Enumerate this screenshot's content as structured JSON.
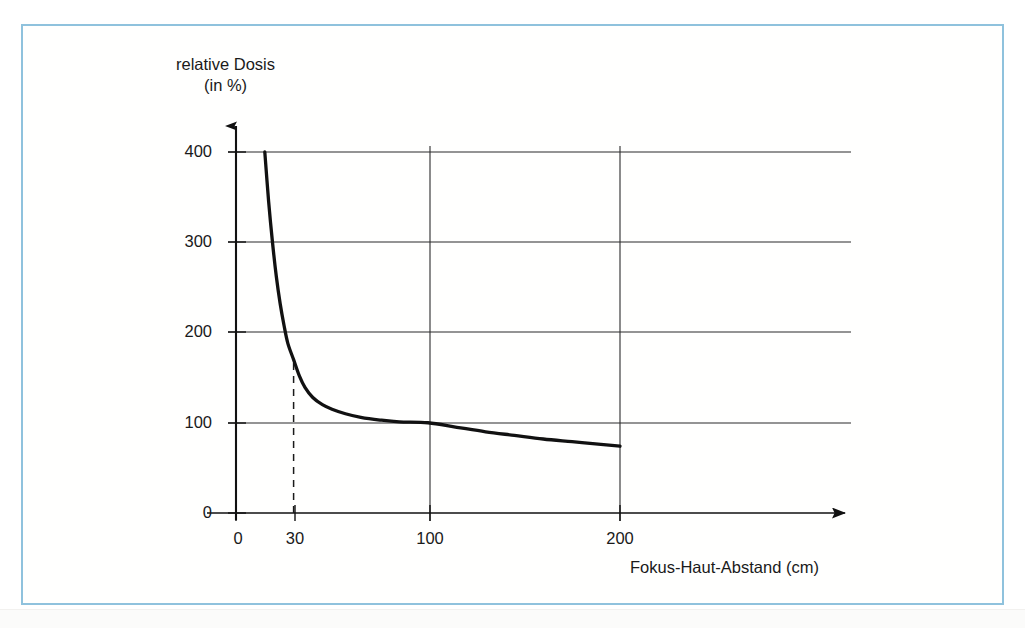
{
  "figure": {
    "frame_color": "#8fc2dd",
    "background": "#ffffff",
    "line_color": "#111111"
  },
  "labels": {
    "y_title_line1": "relative Dosis",
    "y_title_line2": "(in %)",
    "x_title": "Fokus-Haut-Abstand (cm)"
  },
  "chart_data": {
    "type": "line",
    "title": "",
    "subtitle": "",
    "xlabel": "Fokus-Haut-Abstand (cm)",
    "ylabel": "relative Dosis (in %)",
    "xlim": [
      0,
      215
    ],
    "ylim": [
      0,
      420
    ],
    "xticks": [
      0,
      30,
      100,
      200
    ],
    "xtick_labels": [
      "0",
      "30",
      "100",
      "200"
    ],
    "yticks": [
      0,
      100,
      200,
      300,
      400
    ],
    "ytick_labels": [
      "0",
      "100",
      "200",
      "300",
      "400"
    ],
    "grid": true,
    "grid_x_values": [
      100,
      200
    ],
    "grid_y_values": [
      0,
      100,
      200,
      300,
      400
    ],
    "legend": null,
    "series": [
      {
        "name": "relative Dosis",
        "formula": "100 * (100 / d)^2",
        "x": [
          15,
          16,
          17,
          18,
          19,
          20,
          22,
          24,
          26,
          28,
          30,
          33,
          36,
          40,
          45,
          50,
          55,
          60,
          70,
          80,
          90,
          100,
          110,
          120,
          130,
          140,
          150,
          160,
          170,
          180,
          190,
          200
        ],
        "y": [
          400,
          390,
          346,
          309,
          277,
          250,
          207,
          174,
          148,
          128,
          111,
          92,
          77,
          63,
          49,
          40,
          33,
          28,
          20,
          16,
          12,
          100,
          83,
          69,
          59,
          51,
          44,
          39,
          35,
          31,
          28,
          25
        ]
      }
    ],
    "annotations": [
      {
        "type": "dashed-vertical",
        "x": 30,
        "y_from": 0,
        "y_to": 170,
        "label": "30"
      }
    ],
    "reference_points": [
      {
        "x": 30,
        "y": 170
      },
      {
        "x": 100,
        "y": 100
      },
      {
        "x": 200,
        "y": 73
      }
    ]
  },
  "ytick_positions": [
    {
      "label": "400",
      "y": 152
    },
    {
      "label": "300",
      "y": 242
    },
    {
      "label": "200",
      "y": 332
    },
    {
      "label": "100",
      "y": 423
    },
    {
      "label": "0",
      "y": 513
    }
  ],
  "xtick_positions": [
    {
      "label": "0",
      "x": 236
    },
    {
      "label": "30",
      "x": 295
    },
    {
      "label": "100",
      "x": 430
    },
    {
      "label": "200",
      "x": 620
    }
  ]
}
